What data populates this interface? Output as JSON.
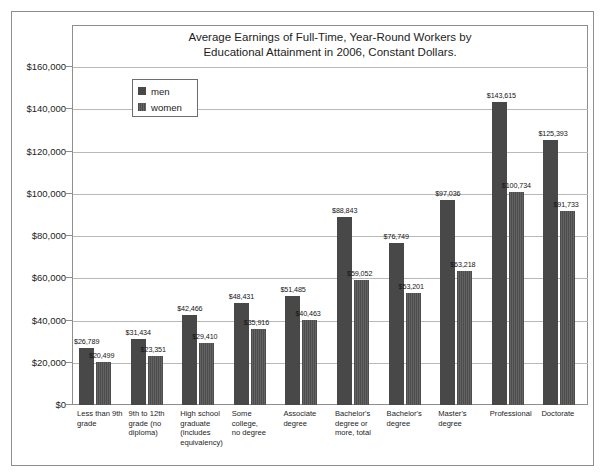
{
  "chart_data": {
    "type": "bar",
    "title_lines": [
      "Average Earnings of Full-Time, Year-Round Workers by",
      "Educational Attainment in 2006, Constant Dollars."
    ],
    "xlabel": "",
    "ylabel": "",
    "ylim": [
      0,
      160000
    ],
    "grid": true,
    "legend_position": "upper left inside plot",
    "ytick_labels": [
      "$160,000",
      "$140,000",
      "$120,000",
      "$100,000",
      "$80,000",
      "$60,000",
      "$40,000",
      "$20,000",
      "$0"
    ],
    "ytick_values": [
      160000,
      140000,
      120000,
      100000,
      80000,
      60000,
      40000,
      20000,
      0
    ],
    "categories": [
      "Less than 9th grade",
      "9th to 12th grade (no diploma)",
      "High school graduate (includes equivalency)",
      "Some college, no degree",
      "Associate degree",
      "Bachelor's degree or more, total",
      "Bachelor's degree",
      "Master's degree",
      "Professional",
      "Doctorate"
    ],
    "category_label_lines": [
      [
        "Less than 9th",
        "grade"
      ],
      [
        "9th to 12th",
        "grade (no",
        "diploma)"
      ],
      [
        "High school",
        "graduate",
        "(includes",
        "equivalency)"
      ],
      [
        "Some college,",
        "no degree"
      ],
      [
        "Associate",
        "degree"
      ],
      [
        "Bachelor's",
        "degree or",
        "more, total"
      ],
      [
        "Bachelor's",
        "degree"
      ],
      [
        "Master's",
        "degree"
      ],
      [
        "Professional"
      ],
      [
        "Doctorate"
      ]
    ],
    "series": [
      {
        "name": "men",
        "color": "#484848",
        "values": [
          26789,
          31434,
          42466,
          48431,
          51485,
          88843,
          76749,
          97036,
          143615,
          125393
        ],
        "labels": [
          "$26,789",
          "$31,434",
          "$42,466",
          "$48,431",
          "$51,485",
          "$88,843",
          "$76,749",
          "$97,036",
          "$143,615",
          "$125,393"
        ]
      },
      {
        "name": "women",
        "color": "#565656",
        "values": [
          20499,
          23351,
          29410,
          35916,
          40463,
          59052,
          53201,
          63218,
          100734,
          91733
        ],
        "labels": [
          "$20,499",
          "$23,351",
          "$29,410",
          "$35,916",
          "$40,463",
          "$59,052",
          "$53,201",
          "$63,218",
          "$100,734",
          "$91,733"
        ]
      }
    ]
  },
  "legend": {
    "items": [
      {
        "label": "men"
      },
      {
        "label": "women"
      }
    ]
  }
}
